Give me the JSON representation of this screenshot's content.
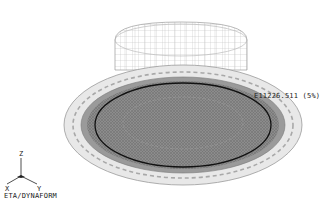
{
  "viewport": {
    "software": "ETA/DYNAFORM",
    "annotation": "E11226.511 (5%)"
  },
  "triad": {
    "z_label": "Z",
    "x_label": "X",
    "y_label": "Y"
  },
  "colors": {
    "background": "#ffffff",
    "mesh_light": "#b0b0b0",
    "blank_fill": "#8a8a8a",
    "outline_dark": "#111111"
  }
}
